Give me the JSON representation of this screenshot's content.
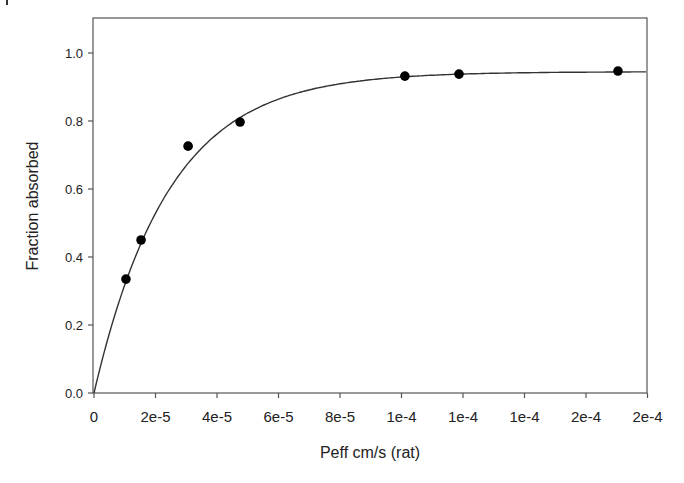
{
  "chart_data": {
    "type": "scatter",
    "title": "",
    "xlabel": "Peff cm/s (rat)",
    "ylabel": "Fraction absorbed",
    "xlim": [
      0,
      0.00018
    ],
    "ylim": [
      0,
      1.1
    ],
    "grid": false,
    "legend": null,
    "x_ticks": [
      {
        "value": 0,
        "label": "0"
      },
      {
        "value": 2e-05,
        "label": "2e-5"
      },
      {
        "value": 4e-05,
        "label": "4e-5"
      },
      {
        "value": 6e-05,
        "label": "6e-5"
      },
      {
        "value": 8e-05,
        "label": "8e-5"
      },
      {
        "value": 0.0001,
        "label": "1e-4"
      },
      {
        "value": 0.00012,
        "label": "1e-4"
      },
      {
        "value": 0.00014,
        "label": "1e-4"
      },
      {
        "value": 0.00016,
        "label": "2e-4"
      },
      {
        "value": 0.00018,
        "label": "2e-4"
      }
    ],
    "y_ticks": [
      {
        "value": 0.0,
        "label": "0.0"
      },
      {
        "value": 0.2,
        "label": "0.2"
      },
      {
        "value": 0.4,
        "label": "0.4"
      },
      {
        "value": 0.6,
        "label": "0.6"
      },
      {
        "value": 0.8,
        "label": "0.8"
      },
      {
        "value": 1.0,
        "label": "1.0"
      }
    ],
    "series": [
      {
        "name": "observed",
        "kind": "scatter",
        "x": [
          1.04e-05,
          1.53e-05,
          3.06e-05,
          4.75e-05,
          0.0001011,
          0.0001187,
          0.0001704
        ],
        "y": [
          0.335,
          0.45,
          0.726,
          0.797,
          0.932,
          0.938,
          0.947
        ]
      },
      {
        "name": "fit",
        "kind": "line",
        "model": "Fa = Fmax * (1 - exp(-k * Peff))",
        "Fmax": 0.945,
        "k": 41000
      }
    ]
  }
}
